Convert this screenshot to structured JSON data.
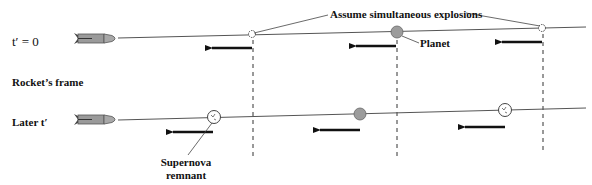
{
  "labels": {
    "top_frame_time": "t′ = 0",
    "frame_label": "Rocket’s frame",
    "bottom_frame_time": "Later t′",
    "callout_explosions": "Assume simultaneous explosions",
    "callout_planet": "Planet",
    "callout_remnant_line1": "Supernova",
    "callout_remnant_line2": "remnant"
  },
  "colors": {
    "rocket_body": "#9a9a9a",
    "planet": "#9c9c9c",
    "arrow": "#111111",
    "line": "#555555"
  },
  "rows": [
    {
      "id": "t0",
      "objects": [
        {
          "type": "explosion",
          "name": "left-explosion"
        },
        {
          "type": "planet",
          "name": "planet"
        },
        {
          "type": "explosion",
          "name": "right-explosion"
        }
      ],
      "motion_direction": "left"
    },
    {
      "id": "later",
      "objects": [
        {
          "type": "remnant",
          "name": "left-remnant"
        },
        {
          "type": "planet",
          "name": "planet"
        },
        {
          "type": "remnant",
          "name": "right-remnant"
        }
      ],
      "motion_direction": "left"
    }
  ]
}
